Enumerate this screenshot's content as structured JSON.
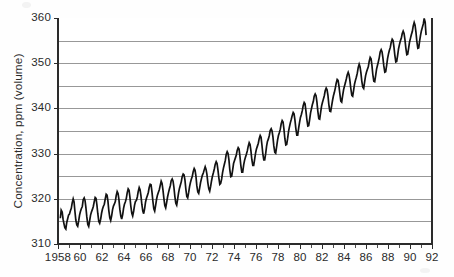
{
  "figure": {
    "background_color": "#fefefe",
    "plot_area": {
      "left": 58,
      "top": 18,
      "right": 432,
      "bottom": 244
    }
  },
  "chart_data": {
    "type": "line",
    "title": "",
    "subtitle": "",
    "xlabel": "",
    "ylabel": "Concentration, ppm (volume)",
    "grid": true,
    "legend": "none",
    "line_color": "#121212",
    "grid_color": "#8d8d8d",
    "axis_color": "#2b2b2b",
    "xlim": [
      1958.0,
      1992.0
    ],
    "ylim": [
      310,
      360
    ],
    "y_major_ticks": [
      310,
      320,
      330,
      340,
      350,
      360
    ],
    "y_major_tick_labels": [
      "310",
      "320",
      "330",
      "340",
      "350",
      "360"
    ],
    "y_gridlines": [
      310,
      315,
      320,
      325,
      330,
      335,
      340,
      345,
      350,
      355,
      360
    ],
    "x_major_ticks": [
      1958,
      1960,
      1962,
      1964,
      1966,
      1968,
      1970,
      1972,
      1974,
      1976,
      1978,
      1980,
      1982,
      1984,
      1986,
      1988,
      1990,
      1992
    ],
    "x_major_tick_labels": [
      "1958",
      "60",
      "62",
      "64",
      "66",
      "68",
      "70",
      "72",
      "74",
      "76",
      "78",
      "80",
      "82",
      "84",
      "86",
      "88",
      "90",
      "92"
    ],
    "x_minor_tick_interval": 1,
    "series": [
      {
        "name": "Atmospheric CO2 concentration",
        "x": [
          1958.21,
          1958.29,
          1958.38,
          1958.46,
          1958.54,
          1958.62,
          1958.71,
          1958.79,
          1958.88,
          1958.96,
          1959.04,
          1959.12,
          1959.21,
          1959.29,
          1959.38,
          1959.46,
          1959.54,
          1959.62,
          1959.71,
          1959.79,
          1959.88,
          1959.96,
          1960.04,
          1960.12,
          1960.21,
          1960.29,
          1960.38,
          1960.46,
          1960.54,
          1960.62,
          1960.71,
          1960.79,
          1960.88,
          1960.96,
          1961.04,
          1961.12,
          1961.21,
          1961.29,
          1961.38,
          1961.46,
          1961.54,
          1961.62,
          1961.71,
          1961.79,
          1961.88,
          1961.96,
          1962.04,
          1962.12,
          1962.21,
          1962.29,
          1962.38,
          1962.46,
          1962.54,
          1962.62,
          1962.71,
          1962.79,
          1962.88,
          1962.96,
          1963.04,
          1963.12,
          1963.21,
          1963.29,
          1963.38,
          1963.46,
          1963.54,
          1963.62,
          1963.71,
          1963.79,
          1963.88,
          1963.96,
          1964.04,
          1964.12,
          1964.21,
          1964.29,
          1964.38,
          1964.46,
          1964.54,
          1964.62,
          1964.71,
          1964.79,
          1964.88,
          1964.96,
          1965.04,
          1965.12,
          1965.21,
          1965.29,
          1965.38,
          1965.46,
          1965.54,
          1965.62,
          1965.71,
          1965.79,
          1965.88,
          1965.96,
          1966.04,
          1966.12,
          1966.21,
          1966.29,
          1966.38,
          1966.46,
          1966.54,
          1966.62,
          1966.71,
          1966.79,
          1966.88,
          1966.96,
          1967.04,
          1967.12,
          1967.21,
          1967.29,
          1967.38,
          1967.46,
          1967.54,
          1967.62,
          1967.71,
          1967.79,
          1967.88,
          1967.96,
          1968.04,
          1968.12,
          1968.21,
          1968.29,
          1968.38,
          1968.46,
          1968.54,
          1968.62,
          1968.71,
          1968.79,
          1968.88,
          1968.96,
          1969.04,
          1969.12,
          1969.21,
          1969.29,
          1969.38,
          1969.46,
          1969.54,
          1969.62,
          1969.71,
          1969.79,
          1969.88,
          1969.96,
          1970.04,
          1970.12,
          1970.21,
          1970.29,
          1970.38,
          1970.46,
          1970.54,
          1970.62,
          1970.71,
          1970.79,
          1970.88,
          1970.96,
          1971.04,
          1971.12,
          1971.21,
          1971.29,
          1971.38,
          1971.46,
          1971.54,
          1971.62,
          1971.71,
          1971.79,
          1971.88,
          1971.96,
          1972.04,
          1972.12,
          1972.21,
          1972.29,
          1972.38,
          1972.46,
          1972.54,
          1972.62,
          1972.71,
          1972.79,
          1972.88,
          1972.96,
          1973.04,
          1973.12,
          1973.21,
          1973.29,
          1973.38,
          1973.46,
          1973.54,
          1973.62,
          1973.71,
          1973.79,
          1973.88,
          1973.96,
          1974.04,
          1974.12,
          1974.21,
          1974.29,
          1974.38,
          1974.46,
          1974.54,
          1974.62,
          1974.71,
          1974.79,
          1974.88,
          1974.96,
          1975.04,
          1975.12,
          1975.21,
          1975.29,
          1975.38,
          1975.46,
          1975.54,
          1975.62,
          1975.71,
          1975.79,
          1975.88,
          1975.96,
          1976.04,
          1976.12,
          1976.21,
          1976.29,
          1976.38,
          1976.46,
          1976.54,
          1976.62,
          1976.71,
          1976.79,
          1976.88,
          1976.96,
          1977.04,
          1977.12,
          1977.21,
          1977.29,
          1977.38,
          1977.46,
          1977.54,
          1977.62,
          1977.71,
          1977.79,
          1977.88,
          1977.96,
          1978.04,
          1978.12,
          1978.21,
          1978.29,
          1978.38,
          1978.46,
          1978.54,
          1978.62,
          1978.71,
          1978.79,
          1978.88,
          1978.96,
          1979.04,
          1979.12,
          1979.21,
          1979.29,
          1979.38,
          1979.46,
          1979.54,
          1979.62,
          1979.71,
          1979.79,
          1979.88,
          1979.96,
          1980.04,
          1980.12,
          1980.21,
          1980.29,
          1980.38,
          1980.46,
          1980.54,
          1980.62,
          1980.71,
          1980.79,
          1980.88,
          1980.96,
          1981.04,
          1981.12,
          1981.21,
          1981.29,
          1981.38,
          1981.46,
          1981.54,
          1981.62,
          1981.71,
          1981.79,
          1981.88,
          1981.96,
          1982.04,
          1982.12,
          1982.21,
          1982.29,
          1982.38,
          1982.46,
          1982.54,
          1982.62,
          1982.71,
          1982.79,
          1982.88,
          1982.96,
          1983.04,
          1983.12,
          1983.21,
          1983.29,
          1983.38,
          1983.46,
          1983.54,
          1983.62,
          1983.71,
          1983.79,
          1983.88,
          1983.96,
          1984.04,
          1984.12,
          1984.21,
          1984.29,
          1984.38,
          1984.46,
          1984.54,
          1984.62,
          1984.71,
          1984.79,
          1984.88,
          1984.96,
          1985.04,
          1985.12,
          1985.21,
          1985.29,
          1985.38,
          1985.46,
          1985.54,
          1985.62,
          1985.71,
          1985.79,
          1985.88,
          1985.96,
          1986.04,
          1986.12,
          1986.21,
          1986.29,
          1986.38,
          1986.46,
          1986.54,
          1986.62,
          1986.71,
          1986.79,
          1986.88,
          1986.96,
          1987.04,
          1987.12,
          1987.21,
          1987.29,
          1987.38,
          1987.46,
          1987.54,
          1987.62,
          1987.71,
          1987.79,
          1987.88,
          1987.96,
          1988.04,
          1988.12,
          1988.21,
          1988.29,
          1988.38,
          1988.46,
          1988.54,
          1988.62,
          1988.71,
          1988.79,
          1988.88,
          1988.96,
          1989.04,
          1989.12,
          1989.21,
          1989.29,
          1989.38,
          1989.46,
          1989.54,
          1989.62,
          1989.71,
          1989.79,
          1989.88,
          1989.96,
          1990.04,
          1990.12,
          1990.21,
          1990.29,
          1990.38,
          1990.46,
          1990.54,
          1990.62,
          1990.71,
          1990.79,
          1990.88,
          1990.96,
          1991.04,
          1991.12,
          1991.21,
          1991.29,
          1991.38,
          1991.46
        ],
        "y": [
          315.7,
          317.5,
          317.1,
          315.5,
          314.5,
          313.6,
          313.3,
          314.7,
          315.6,
          316.4,
          316.6,
          317.3,
          317.9,
          319.1,
          320.0,
          319.3,
          317.2,
          315.3,
          314.2,
          313.9,
          315.1,
          316.4,
          317.2,
          317.8,
          318.3,
          319.8,
          320.2,
          319.6,
          318.0,
          316.0,
          314.3,
          313.9,
          315.2,
          316.4,
          317.1,
          317.6,
          318.3,
          319.3,
          320.3,
          320.1,
          318.6,
          316.7,
          315.0,
          314.6,
          315.5,
          316.8,
          317.7,
          318.3,
          318.8,
          319.9,
          321.0,
          320.8,
          319.5,
          317.4,
          315.8,
          315.2,
          316.3,
          317.6,
          318.4,
          318.8,
          319.4,
          320.7,
          321.6,
          321.2,
          319.8,
          317.7,
          316.2,
          315.5,
          316.5,
          317.9,
          318.8,
          319.3,
          320.1,
          321.3,
          322.2,
          321.9,
          320.3,
          318.4,
          316.8,
          316.2,
          317.3,
          318.6,
          319.4,
          319.6,
          320.4,
          321.6,
          322.5,
          322.0,
          320.7,
          318.8,
          317.3,
          316.7,
          317.9,
          319.3,
          320.1,
          320.7,
          321.4,
          322.5,
          323.2,
          323.1,
          321.6,
          319.6,
          317.8,
          317.3,
          318.6,
          319.9,
          320.8,
          321.4,
          322.0,
          322.9,
          323.9,
          323.4,
          322.0,
          320.2,
          318.5,
          318.0,
          319.2,
          320.4,
          321.3,
          322.1,
          322.9,
          324.0,
          324.4,
          323.9,
          322.5,
          320.6,
          319.0,
          318.6,
          320.0,
          321.3,
          322.3,
          323.0,
          323.8,
          324.9,
          325.5,
          325.3,
          324.2,
          322.2,
          320.5,
          320.2,
          321.4,
          322.7,
          323.6,
          324.3,
          325.0,
          326.0,
          326.7,
          326.3,
          325.0,
          322.9,
          321.5,
          321.2,
          322.4,
          323.6,
          324.4,
          325.2,
          325.7,
          326.4,
          327.1,
          326.5,
          325.4,
          323.6,
          322.2,
          321.7,
          322.8,
          324.0,
          325.0,
          325.7,
          326.6,
          327.6,
          328.2,
          327.8,
          326.4,
          324.7,
          323.2,
          323.4,
          324.4,
          325.8,
          326.8,
          327.6,
          328.5,
          329.8,
          330.4,
          330.0,
          328.6,
          326.4,
          324.9,
          325.0,
          326.4,
          327.8,
          328.4,
          329.0,
          329.7,
          330.7,
          331.3,
          331.0,
          329.4,
          327.4,
          325.9,
          325.9,
          327.5,
          328.5,
          329.2,
          329.8,
          330.6,
          331.6,
          332.4,
          332.0,
          330.6,
          328.7,
          327.4,
          327.4,
          328.8,
          330.1,
          331.0,
          331.6,
          332.3,
          333.3,
          334.0,
          333.6,
          331.9,
          330.0,
          328.6,
          328.6,
          330.0,
          331.6,
          332.7,
          333.2,
          334.0,
          335.1,
          335.5,
          335.0,
          333.7,
          331.7,
          330.3,
          330.1,
          331.6,
          333.0,
          334.0,
          334.6,
          335.4,
          336.6,
          337.3,
          337.0,
          335.4,
          333.4,
          331.9,
          332.0,
          333.4,
          334.9,
          335.9,
          336.8,
          337.6,
          338.4,
          339.1,
          338.8,
          337.4,
          335.6,
          334.1,
          334.1,
          335.7,
          336.9,
          338.0,
          338.6,
          339.5,
          340.6,
          341.3,
          341.0,
          339.4,
          337.6,
          336.1,
          336.2,
          337.6,
          339.0,
          339.9,
          340.8,
          341.5,
          342.7,
          343.2,
          342.8,
          341.4,
          339.4,
          337.7,
          337.6,
          339.2,
          340.5,
          341.3,
          342.0,
          342.8,
          343.9,
          344.5,
          344.1,
          342.9,
          340.9,
          339.4,
          339.3,
          340.6,
          341.8,
          342.8,
          343.5,
          344.5,
          345.6,
          346.4,
          346.2,
          345.0,
          343.3,
          341.6,
          341.4,
          342.9,
          344.1,
          344.9,
          345.6,
          346.5,
          347.4,
          348.0,
          347.4,
          346.1,
          344.4,
          342.9,
          342.7,
          344.1,
          345.4,
          346.2,
          346.9,
          347.8,
          349.0,
          349.8,
          349.2,
          347.8,
          346.0,
          344.7,
          344.4,
          345.9,
          347.2,
          348.0,
          348.6,
          349.2,
          350.4,
          351.3,
          351.0,
          349.5,
          347.5,
          346.0,
          345.9,
          347.3,
          348.7,
          349.5,
          350.3,
          351.3,
          352.5,
          353.0,
          352.5,
          351.1,
          349.4,
          348.0,
          348.1,
          349.6,
          351.0,
          352.0,
          352.8,
          353.5,
          354.6,
          355.3,
          355.0,
          353.6,
          351.8,
          350.3,
          350.4,
          351.8,
          353.2,
          354.1,
          354.9,
          355.5,
          356.5,
          357.1,
          356.6,
          355.2,
          353.4,
          351.9,
          352.0,
          353.4,
          354.7,
          355.5,
          356.3,
          357.0,
          358.2,
          359.0,
          358.4,
          356.9,
          354.9,
          353.3,
          353.4,
          355.0,
          356.2,
          357.2,
          357.9,
          358.7,
          359.9,
          359.1,
          356.2
        ]
      }
    ]
  },
  "annotations": {
    "y_axis_label": "Concentration, ppm (volume)"
  }
}
